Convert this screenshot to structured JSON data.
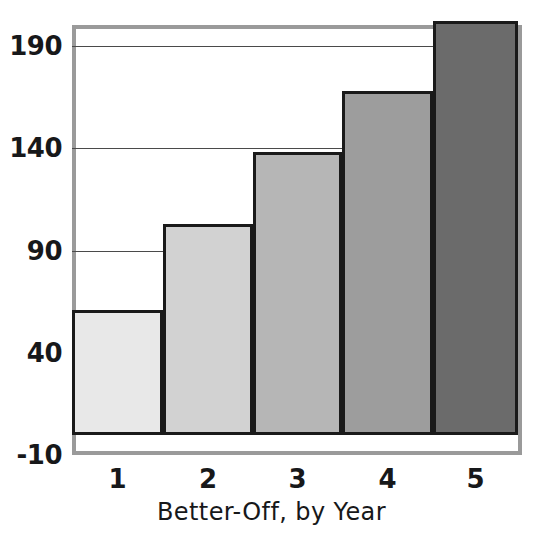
{
  "chart_data": {
    "type": "bar",
    "title": "",
    "subtitle": "",
    "xlabel": "Better-Off, by Year",
    "ylabel": "",
    "categories": [
      "1",
      "2",
      "3",
      "4",
      "5"
    ],
    "values": [
      61,
      103,
      138,
      168,
      202
    ],
    "series": [
      {
        "name": "Better-Off",
        "values": [
          61,
          103,
          138,
          168,
          202
        ]
      }
    ],
    "ytick_labels": [
      "190",
      "140",
      "90",
      "40",
      "-10"
    ],
    "ytick_values": [
      190,
      140,
      90,
      40,
      -10
    ],
    "ylim": [
      -10,
      200
    ],
    "xlim": [
      0.5,
      5.5
    ],
    "grid": "horizontal-major-behind-bars",
    "legend": "none",
    "bar_colors": [
      "#e8e8e8",
      "#d2d2d2",
      "#b6b6b6",
      "#9d9d9d",
      "#6b6b6b"
    ],
    "bar_edge_color": "#1a1a1a",
    "gridline_color": "#4a4a4a",
    "frame_color": "#9a9a9a",
    "background_color": "#ffffff",
    "text_color": "#17181a",
    "annotations": []
  }
}
